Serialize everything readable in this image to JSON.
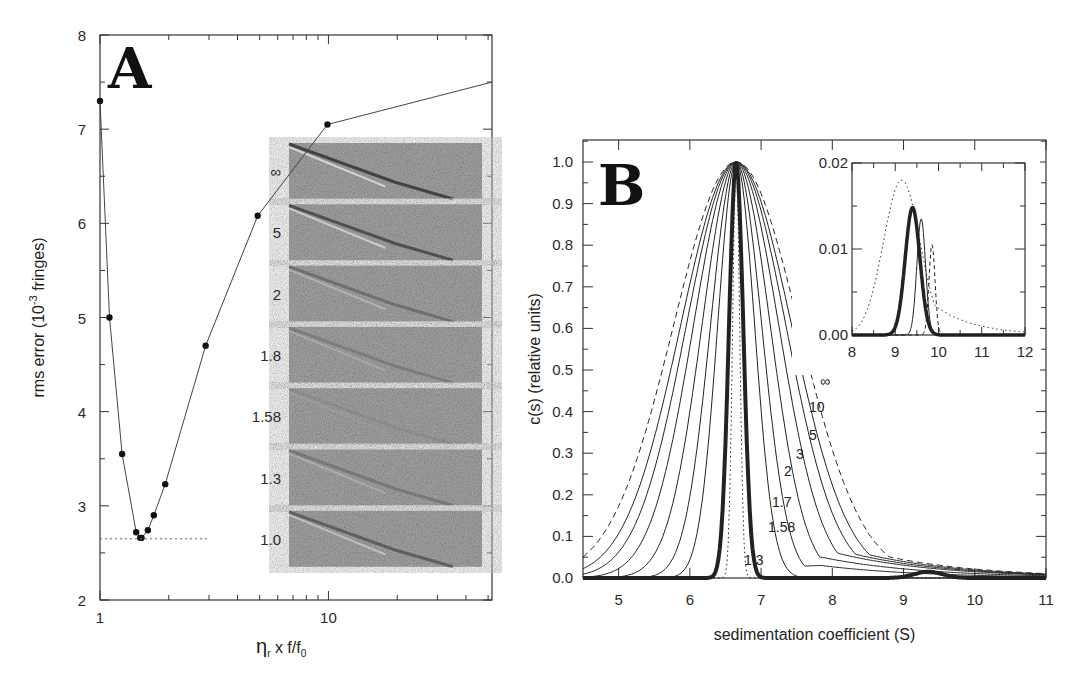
{
  "chart_data": [
    {
      "panel": "A",
      "type": "scatter",
      "title": "",
      "panel_label": "A",
      "xlabel": "η_r x f/f_0",
      "xlabel_parts": {
        "eta": "η",
        "sub_r": "r",
        "mid": " x f/f",
        "sub_0": "0"
      },
      "ylabel": "rms error (10^-3 fringes)",
      "ylabel_parts": {
        "pre": "rms error (10",
        "sup": "-3",
        "post": " fringes)"
      },
      "xscale": "log",
      "xlim": [
        1,
        52
      ],
      "ylim": [
        2,
        8
      ],
      "x_tick_labels": [
        "1",
        "10"
      ],
      "y_tick_labels": [
        "2",
        "3",
        "4",
        "5",
        "6",
        "7",
        "8"
      ],
      "grid": false,
      "series": [
        {
          "name": "rms error",
          "style": "points-with-line",
          "x": [
            1.0,
            1.1,
            1.25,
            1.44,
            1.5,
            1.52,
            1.62,
            1.72,
            1.93,
            2.9,
            4.9,
            9.9,
            52
          ],
          "y": [
            7.3,
            5.0,
            3.55,
            2.72,
            2.66,
            2.66,
            2.74,
            2.9,
            3.23,
            4.7,
            6.08,
            7.05,
            7.5
          ]
        },
        {
          "name": "minimum reference",
          "style": "dotted",
          "x": [
            1.0,
            3.0
          ],
          "y": [
            2.65,
            2.65
          ]
        }
      ],
      "inset_residual_maps": {
        "labels": [
          "∞",
          "5",
          "2",
          "1.8",
          "1.58",
          "1.3",
          "1.0"
        ],
        "description": "grayscale residual bitmaps for each frictional ratio factor"
      }
    },
    {
      "panel": "B",
      "type": "line",
      "title": "",
      "panel_label": "B",
      "xlabel": "sedimentation coefficient (S)",
      "ylabel": "c(s) (relative units)",
      "xlim": [
        4.5,
        11
      ],
      "ylim": [
        0.0,
        1.05
      ],
      "x_tick_labels": [
        "5",
        "6",
        "7",
        "8",
        "9",
        "10",
        "11"
      ],
      "y_tick_labels": [
        "0.0",
        "0.1",
        "0.2",
        "0.3",
        "0.4",
        "0.5",
        "0.6",
        "0.7",
        "0.8",
        "0.9",
        "1.0"
      ],
      "grid": false,
      "peak_s": 6.65,
      "series": [
        {
          "name": "∞",
          "style": "dashed",
          "width_sigma": 0.88,
          "tail": 0.1
        },
        {
          "name": "10",
          "style": "solid",
          "width_sigma": 0.78,
          "tail": 0.09
        },
        {
          "name": "5",
          "style": "solid",
          "width_sigma": 0.7,
          "tail": 0.08
        },
        {
          "name": "3",
          "style": "solid",
          "width_sigma": 0.6,
          "tail": 0.07
        },
        {
          "name": "2",
          "style": "solid",
          "width_sigma": 0.48,
          "tail": 0.05
        },
        {
          "name": "1.7",
          "style": "solid",
          "width_sigma": 0.36,
          "tail": 0.03
        },
        {
          "name": "1.58",
          "style": "solid",
          "width_sigma": 0.26,
          "tail": 0.0
        },
        {
          "name": "1.3",
          "style": "dotted",
          "width_sigma": 0.05,
          "tail": 0.0
        },
        {
          "name": "best fit",
          "style": "bold",
          "width_sigma": 0.1,
          "tail": 0.0,
          "secondary_peak": {
            "s": 9.35,
            "height": 0.015
          }
        }
      ],
      "curve_labels": [
        "∞",
        "10",
        "5",
        "3",
        "2",
        "1.7",
        "1.58",
        "1.3"
      ],
      "inset": {
        "xlim": [
          8,
          12
        ],
        "ylim": [
          0.0,
          0.02
        ],
        "x_tick_labels": [
          "8",
          "9",
          "10",
          "11",
          "12"
        ],
        "y_tick_labels": [
          "0.00",
          "0.01",
          "0.02"
        ],
        "series": [
          {
            "name": "dotted",
            "style": "dotted",
            "peak_s": 9.15,
            "peak_y": 0.018
          },
          {
            "name": "bold",
            "style": "bold",
            "peak_s": 9.4,
            "peak_y": 0.0148
          },
          {
            "name": "thin",
            "style": "solid",
            "peak_s": 9.6,
            "peak_y": 0.0135
          },
          {
            "name": "dashed",
            "style": "dashed",
            "peak_s": 9.85,
            "peak_y": 0.0105
          }
        ]
      }
    }
  ]
}
